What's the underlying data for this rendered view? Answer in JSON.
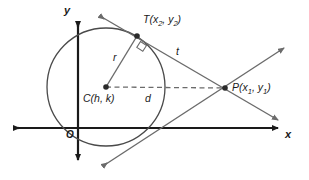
{
  "figure": {
    "colors": {
      "axis": "#1a1a1a",
      "circle": "#4a4a4a",
      "line": "#6b6b6b",
      "dashed": "#6b6b6b",
      "point": "#2b2b2b",
      "label": "#1a1a1a",
      "background": "#ffffff"
    }
  },
  "axes": {
    "x_label": "x",
    "y_label": "y",
    "origin_label": "O"
  },
  "points": {
    "center": {
      "label": "C(h, k)",
      "name": "C",
      "coord_x": "h",
      "coord_y": "k"
    },
    "tangency": {
      "label": "T(x2, y2)",
      "name": "T",
      "coord_x": "x",
      "coord_x_sub": "2",
      "coord_y": "y",
      "coord_y_sub": "2"
    },
    "external": {
      "label": "P(x1, y1)",
      "name": "P",
      "coord_x": "x",
      "coord_x_sub": "1",
      "coord_y": "y",
      "coord_y_sub": "1"
    }
  },
  "segments": {
    "radius_label": "r",
    "tangent_label": "t",
    "distance_label": "d"
  },
  "markers": {
    "right_angle": "right-angle-marker"
  }
}
